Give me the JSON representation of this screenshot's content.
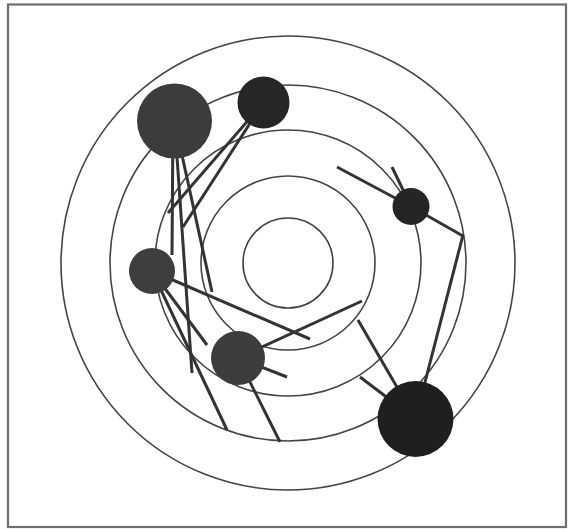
{
  "canvas": {
    "width": 569,
    "height": 529,
    "background": "#ffffff"
  },
  "frame": {
    "x": 8,
    "y": 4.5,
    "width": 558,
    "height": 522.5,
    "stroke": "#6e6e6e",
    "stroke_width": 2.2
  },
  "rings": {
    "center": [
      288,
      263
    ],
    "radii": [
      45,
      87,
      133,
      178,
      227
    ],
    "stroke": "#444444",
    "stroke_width": 1.6
  },
  "edge_style": {
    "stroke": "#333333",
    "stroke_width": 3
  },
  "nodes": [
    {
      "id": "node-top-left-large",
      "cx": 174.5,
      "cy": 121,
      "r": 37.5,
      "fill": "#3c3c3c"
    },
    {
      "id": "node-top",
      "cx": 263.5,
      "cy": 102.5,
      "r": 26,
      "fill": "#262626"
    },
    {
      "id": "node-right",
      "cx": 411,
      "cy": 206.5,
      "r": 18.5,
      "fill": "#252525"
    },
    {
      "id": "node-left",
      "cx": 152,
      "cy": 271,
      "r": 23,
      "fill": "#3e3e3e"
    },
    {
      "id": "node-bottom-middle",
      "cx": 238,
      "cy": 358,
      "r": 27,
      "fill": "#3d3d3d"
    },
    {
      "id": "node-bottom-right-large",
      "cx": 415.5,
      "cy": 419,
      "r": 38,
      "fill": "#1f1f1f"
    }
  ],
  "edges": [
    {
      "from": [
        173,
        121
      ],
      "to": [
        172,
        255
      ]
    },
    {
      "from": [
        174.5,
        121
      ],
      "to": [
        192,
        373
      ]
    },
    {
      "from": [
        174.5,
        121
      ],
      "to": [
        212,
        292
      ]
    },
    {
      "from": [
        263.5,
        102.5
      ],
      "to": [
        168,
        213
      ]
    },
    {
      "from": [
        263.5,
        102.5
      ],
      "to": [
        183,
        227
      ]
    },
    {
      "from": [
        152,
        271
      ],
      "to": [
        310,
        339
      ]
    },
    {
      "from": [
        152,
        271
      ],
      "to": [
        207,
        345
      ]
    },
    {
      "from": [
        152,
        271
      ],
      "to": [
        227,
        430
      ]
    },
    {
      "from": [
        238,
        358
      ],
      "to": [
        362,
        301
      ]
    },
    {
      "from": [
        238,
        358
      ],
      "to": [
        287,
        377
      ]
    },
    {
      "from": [
        238,
        358
      ],
      "to": [
        280,
        442
      ]
    },
    {
      "from": [
        415.5,
        419
      ],
      "to": [
        463,
        235
      ]
    },
    {
      "from": [
        415.5,
        419
      ],
      "to": [
        358,
        320
      ]
    },
    {
      "from": [
        415.5,
        419
      ],
      "to": [
        360,
        377
      ]
    },
    {
      "from": [
        411,
        206.5
      ],
      "to": [
        337,
        167
      ]
    },
    {
      "from": [
        411,
        206.5
      ],
      "to": [
        392,
        167
      ]
    },
    {
      "from": [
        411,
        206.5
      ],
      "to": [
        463,
        236
      ]
    }
  ]
}
